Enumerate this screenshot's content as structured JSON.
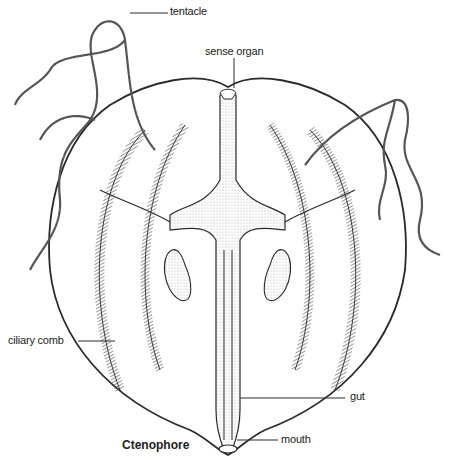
{
  "title": "Ctenophore",
  "labels": {
    "tentacle": "tentacle",
    "sense_organ": "sense organ",
    "ciliary_comb": "ciliary comb",
    "gut": "gut",
    "mouth": "mouth"
  },
  "colors": {
    "line": "#2a2a2a",
    "stipple": "#bdbdbd",
    "background": "#ffffff"
  }
}
